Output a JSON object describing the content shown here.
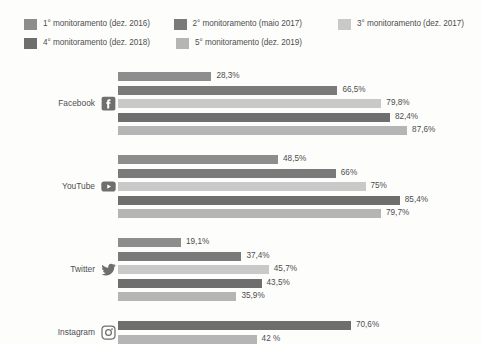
{
  "legend": {
    "items": [
      {
        "label": "1° monitoramento (dez. 2016)",
        "color": "#8d8d8d"
      },
      {
        "label": "2° monitoramento (maio 2017)",
        "color": "#7a7a7a"
      },
      {
        "label": "3° monitoramento (dez. 2017)",
        "color": "#c9c9c9"
      },
      {
        "label": "4° monitoramento (dez. 2018)",
        "color": "#6e6e6e"
      },
      {
        "label": "5° monitoramento (dez. 2019)",
        "color": "#b5b5b5"
      }
    ]
  },
  "chart_data": {
    "type": "bar",
    "orientation": "horizontal",
    "title": "",
    "subtitle": "",
    "xlabel": "",
    "ylabel": "",
    "xlim": [
      0,
      100
    ],
    "unit": "%",
    "grid": false,
    "legend_position": "top-left",
    "categories": [
      "Facebook",
      "YouTube",
      "Twitter",
      "Instagram"
    ],
    "category_icons": [
      "facebook-icon",
      "youtube-icon",
      "twitter-icon",
      "instagram-icon"
    ],
    "series": [
      {
        "name": "1° monitoramento (dez. 2016)",
        "color": "#8d8d8d",
        "values": [
          28.3,
          48.5,
          19.1,
          null
        ],
        "labels": [
          "28,3%",
          "48,5%",
          "19,1%",
          null
        ]
      },
      {
        "name": "2° monitoramento (maio 2017)",
        "color": "#7a7a7a",
        "values": [
          66.5,
          66,
          37.4,
          null
        ],
        "labels": [
          "66,5%",
          "66%",
          "37,4%",
          null
        ]
      },
      {
        "name": "3° monitoramento (dez. 2017)",
        "color": "#c9c9c9",
        "values": [
          79.8,
          75,
          45.7,
          null
        ],
        "labels": [
          "79,8%",
          "75%",
          "45,7%",
          null
        ]
      },
      {
        "name": "4° monitoramento (dez. 2018)",
        "color": "#6e6e6e",
        "values": [
          82.4,
          85.4,
          43.5,
          70.6
        ],
        "labels": [
          "82,4%",
          "85,4%",
          "43,5%",
          "70,6%"
        ]
      },
      {
        "name": "5° monitoramento (dez. 2019)",
        "color": "#b5b5b5",
        "values": [
          87.6,
          79.7,
          35.9,
          42
        ],
        "labels": [
          "87,6%",
          "79,7%",
          "35,9%",
          "42 %"
        ]
      }
    ]
  }
}
